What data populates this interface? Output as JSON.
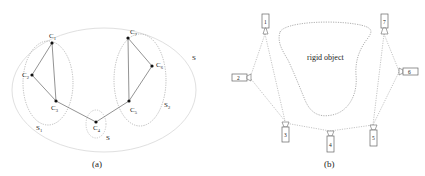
{
  "panel_a": {
    "caption": "(a)",
    "outer_set_label": "S",
    "subsets": [
      {
        "id": "s1",
        "label": "S",
        "sub": "1"
      },
      {
        "id": "s2",
        "label": "S",
        "sub": "2"
      },
      {
        "id": "s3",
        "label": "S",
        "sub": ""
      }
    ],
    "nodes": [
      {
        "id": "c1",
        "label": "C",
        "sub": "1"
      },
      {
        "id": "c2",
        "label": "C",
        "sub": "2"
      },
      {
        "id": "c3",
        "label": "C",
        "sub": "3"
      },
      {
        "id": "c4",
        "label": "C",
        "sub": "4"
      },
      {
        "id": "c5",
        "label": "C",
        "sub": "5"
      },
      {
        "id": "c6",
        "label": "C",
        "sub": "6"
      },
      {
        "id": "c7",
        "label": "C",
        "sub": "7"
      }
    ]
  },
  "panel_b": {
    "caption": "(b)",
    "object_label": "rigid object",
    "cameras": [
      "1",
      "2",
      "3",
      "4",
      "5",
      "6",
      "7"
    ]
  },
  "colors": {
    "line": "#777777",
    "dotted": "#999999",
    "outer": "#dddddd",
    "text": "#222222"
  }
}
